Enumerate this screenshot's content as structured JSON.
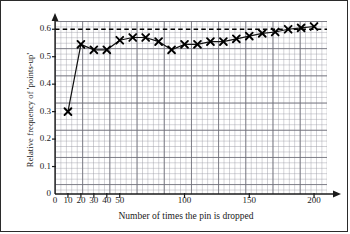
{
  "chart_data": {
    "type": "line",
    "title": "",
    "xlabel": "Number of times the pin is dropped",
    "ylabel": "Relative frequency of 'points-up'",
    "xlim": [
      0,
      210
    ],
    "ylim": [
      0,
      0.63
    ],
    "grid": true,
    "legend": "none",
    "marker": "x",
    "xticks": [
      0,
      10,
      20,
      30,
      40,
      50,
      100,
      150,
      200
    ],
    "xtick_labels": [
      "0",
      "10",
      "20",
      "30",
      "40",
      "50",
      "100",
      "150",
      "200"
    ],
    "yticks": [
      0,
      0.1,
      0.2,
      0.3,
      0.4,
      0.5,
      0.6
    ],
    "ytick_labels": [
      "0",
      "0.1",
      "0.2",
      "0.3",
      "0.4",
      "0.5",
      "0.6"
    ],
    "annotations": [
      {
        "type": "hline",
        "y": 0.6,
        "style": "dashed",
        "color": "#000000"
      }
    ],
    "x": [
      10,
      20,
      30,
      40,
      50,
      60,
      70,
      80,
      90,
      100,
      110,
      120,
      130,
      140,
      150,
      160,
      170,
      180,
      190,
      200
    ],
    "values": [
      0.3,
      0.545,
      0.525,
      0.525,
      0.56,
      0.57,
      0.57,
      0.555,
      0.525,
      0.545,
      0.545,
      0.555,
      0.555,
      0.565,
      0.575,
      0.585,
      0.59,
      0.6,
      0.605,
      0.61
    ],
    "series": [
      {
        "name": "Relative frequency of 'points-up'",
        "x": [
          10,
          20,
          30,
          40,
          50,
          60,
          70,
          80,
          90,
          100,
          110,
          120,
          130,
          140,
          150,
          160,
          170,
          180,
          190,
          200
        ],
        "values": [
          0.3,
          0.545,
          0.525,
          0.525,
          0.56,
          0.57,
          0.57,
          0.555,
          0.525,
          0.545,
          0.545,
          0.555,
          0.555,
          0.565,
          0.575,
          0.585,
          0.59,
          0.6,
          0.605,
          0.61
        ]
      }
    ]
  },
  "axis": {
    "y_title": "Relative frequency of 'points-up'",
    "x_title": "Number of times the pin is dropped"
  }
}
